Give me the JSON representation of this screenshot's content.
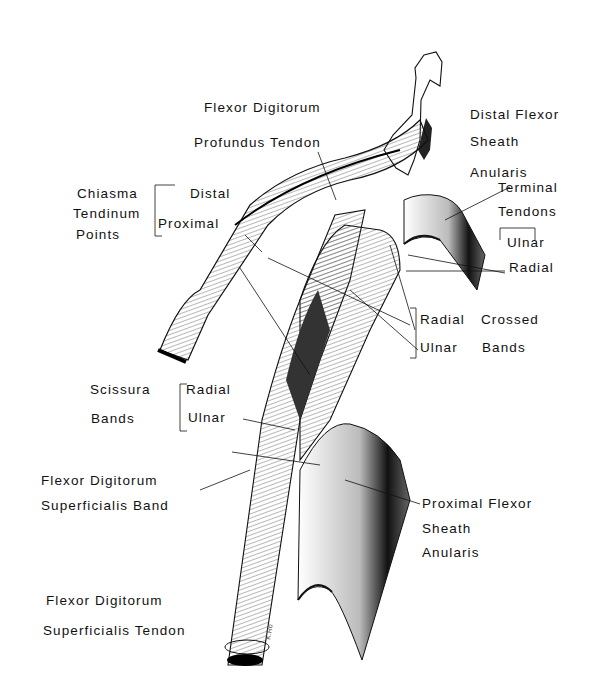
{
  "figure": {
    "labels": {
      "fdp_line1": "Flexor Digitorum",
      "fdp_line2": "Profundus Tendon",
      "distal_sheath_line1": "Distal Flexor",
      "distal_sheath_line2": "Sheath",
      "distal_sheath_line3": "Anularis",
      "chiasma_line1": "Chiasma",
      "chiasma_line2": "Tendinum",
      "chiasma_line3": "Points",
      "chiasma_distal": "Distal",
      "chiasma_proximal": "Proximal",
      "terminal_line1": "Terminal",
      "terminal_line2": "Tendons",
      "terminal_ulnar": "Ulnar",
      "terminal_radial": "Radial",
      "crossed_radial": "Radial",
      "crossed_ulnar": "Ulnar",
      "crossed_line1": "Crossed",
      "crossed_line2": "Bands",
      "scissura_line1": "Scissura",
      "scissura_line2": "Bands",
      "scissura_radial": "Radial",
      "scissura_ulnar": "Ulnar",
      "fds_band_line1": "Flexor Digitorum",
      "fds_band_line2": "Superficialis Band",
      "proximal_sheath_line1": "Proximal Flexor",
      "proximal_sheath_line2": "Sheath",
      "proximal_sheath_line3": "Anularis",
      "fds_tendon_line1": "Flexor Digitorum",
      "fds_tendon_line2": "Superficialis Tendon"
    },
    "colors": {
      "ink": "#111111",
      "background": "#ffffff"
    }
  }
}
